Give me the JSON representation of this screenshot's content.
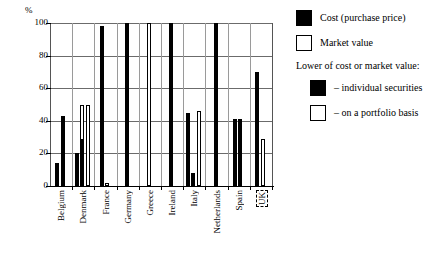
{
  "chart_data": {
    "type": "bar",
    "title": "",
    "xlabel": "",
    "ylabel": "%",
    "ylim": [
      0,
      100
    ],
    "yticks": [
      0,
      20,
      40,
      60,
      80,
      100
    ],
    "grid": true,
    "legend_position": "right",
    "categories": [
      "Belgium",
      "Denmark",
      "France",
      "Germany",
      "Greece",
      "Ireland",
      "Italy",
      "Netherlands",
      "Spain",
      "UK"
    ],
    "legend": [
      {
        "key": "cost",
        "label": "Cost (purchase price)",
        "style": "black"
      },
      {
        "key": "market",
        "label": "Market value",
        "style": "white"
      },
      {
        "key": "heading",
        "label": "Lower of cost or market value:",
        "style": "heading"
      },
      {
        "key": "lower_individual",
        "label": "– individual securities",
        "style": "black"
      },
      {
        "key": "lower_portfolio",
        "label": "– on a portfolio basis",
        "style": "white"
      }
    ],
    "groups": [
      {
        "name": "Belgium",
        "bars": [
          {
            "series": "cost",
            "value": 14,
            "style": "black"
          },
          {
            "series": "lower_individual",
            "value": 43,
            "style": "black"
          }
        ]
      },
      {
        "name": "Denmark",
        "bars": [
          {
            "series": "cost",
            "value": 20,
            "style": "black"
          },
          {
            "series": "lower_individual",
            "value": 29,
            "style": "split",
            "outline_to": 50
          },
          {
            "series": "lower_portfolio",
            "value": 50,
            "style": "white"
          }
        ]
      },
      {
        "name": "France",
        "bars": [
          {
            "series": "cost",
            "value": 98,
            "style": "black"
          },
          {
            "series": "market",
            "value": 2,
            "style": "white"
          }
        ]
      },
      {
        "name": "Germany",
        "bars": [
          {
            "series": "cost",
            "value": 100,
            "style": "black"
          }
        ]
      },
      {
        "name": "Greece",
        "bars": [
          {
            "series": "market",
            "value": 100,
            "style": "white"
          }
        ]
      },
      {
        "name": "Ireland",
        "bars": [
          {
            "series": "cost",
            "value": 100,
            "style": "black"
          }
        ]
      },
      {
        "name": "Italy",
        "bars": [
          {
            "series": "cost",
            "value": 45,
            "style": "black"
          },
          {
            "series": "lower_individual",
            "value": 8,
            "style": "black"
          },
          {
            "series": "lower_portfolio",
            "value": 46,
            "style": "white"
          }
        ]
      },
      {
        "name": "Netherlands",
        "bars": [
          {
            "series": "cost",
            "value": 100,
            "style": "black"
          }
        ]
      },
      {
        "name": "Spain",
        "bars": [
          {
            "series": "cost",
            "value": 41,
            "style": "black"
          },
          {
            "series": "lower_individual",
            "value": 41,
            "style": "black"
          }
        ]
      },
      {
        "name": "UK",
        "bars": [
          {
            "series": "lower_individual",
            "value": 70,
            "style": "black"
          },
          {
            "series": "lower_portfolio",
            "value": 29,
            "style": "white"
          }
        ]
      }
    ]
  },
  "axis": {
    "unit": "%",
    "ticks": [
      "100",
      "80",
      "60",
      "40",
      "20",
      "0"
    ]
  },
  "xaxis": {
    "labels": [
      {
        "text": "Belgium",
        "boxed": false
      },
      {
        "text": "Denmark",
        "boxed": false
      },
      {
        "text": "France",
        "boxed": false
      },
      {
        "text": "Germany",
        "boxed": false
      },
      {
        "text": "Greece",
        "boxed": false
      },
      {
        "text": "Ireland",
        "boxed": false
      },
      {
        "text": "Italy",
        "boxed": false
      },
      {
        "text": "Netherlands",
        "boxed": false
      },
      {
        "text": "Spain",
        "boxed": false
      },
      {
        "text": "UK",
        "boxed": true
      }
    ]
  },
  "legend": {
    "cost_label": "Cost (purchase price)",
    "market_label": "Market value",
    "lower_heading": "Lower of cost or market value:",
    "lower_individual_label": "– individual securities",
    "lower_portfolio_label": "– on a portfolio basis"
  },
  "colors": {
    "bar_black": "#000000",
    "bar_white": "#ffffff",
    "grid": "#6b6b6b",
    "axis": "#000000",
    "background": "#ffffff"
  }
}
